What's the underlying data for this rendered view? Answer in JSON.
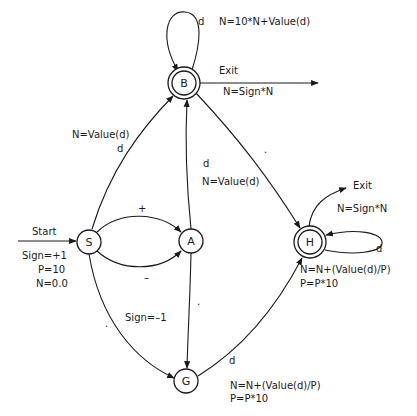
{
  "diagram": {
    "type": "finite-state-automaton",
    "nodes": [
      {
        "id": "S",
        "label": "S",
        "accepting": false
      },
      {
        "id": "A",
        "label": "A",
        "accepting": false
      },
      {
        "id": "B",
        "label": "B",
        "accepting": true
      },
      {
        "id": "G",
        "label": "G",
        "accepting": false
      },
      {
        "id": "H",
        "label": "H",
        "accepting": true
      }
    ],
    "start": {
      "label": "Start",
      "actions": [
        "Sign=+1",
        "P=10",
        "N=0.0"
      ]
    },
    "edges": {
      "b_loop": {
        "input": "d",
        "action": "N=10*N+Value(d)"
      },
      "b_exit": {
        "input": "Exit",
        "action": "N=Sign*N"
      },
      "s_to_b": {
        "input": "d",
        "action": "N=Value(d)"
      },
      "a_to_b": {
        "input": "d",
        "action": "N=Value(d)"
      },
      "s_to_a_plus": {
        "input": "+"
      },
      "s_to_a_minus": {
        "input": "–",
        "action": "Sign=–1"
      },
      "s_to_g": {
        "input": "."
      },
      "a_to_g": {
        "input": "."
      },
      "b_to_h": {
        "input": "."
      },
      "g_to_h": {
        "input": "d",
        "action_line1": "N=N+(Value(d)/P)",
        "action_line2": "P=P*10"
      },
      "h_loop": {
        "input": "d",
        "action_line1": "N=N+(Value(d)/P)",
        "action_line2": "P=P*10"
      },
      "h_exit": {
        "input": "Exit",
        "action": "N=Sign*N"
      }
    }
  }
}
